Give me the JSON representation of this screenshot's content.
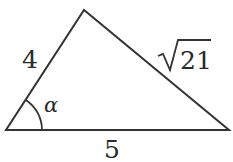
{
  "figure": {
    "type": "triangle",
    "vertices": {
      "bottom_left": [
        6,
        130
      ],
      "bottom_right": [
        229,
        130
      ],
      "apex": [
        84,
        10
      ]
    },
    "labels": {
      "left_side": "4",
      "right_side_radicand": "21",
      "right_side_radical": "√",
      "base": "5",
      "angle": "α"
    },
    "stroke_color": "#333333"
  }
}
